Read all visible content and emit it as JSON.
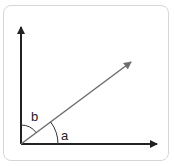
{
  "diagram": {
    "labels": {
      "angle_a": "a",
      "angle_b": "b"
    },
    "colors": {
      "axes": "#222222",
      "ray": "#6e6e6e",
      "frame": "#d6d6d6"
    }
  }
}
